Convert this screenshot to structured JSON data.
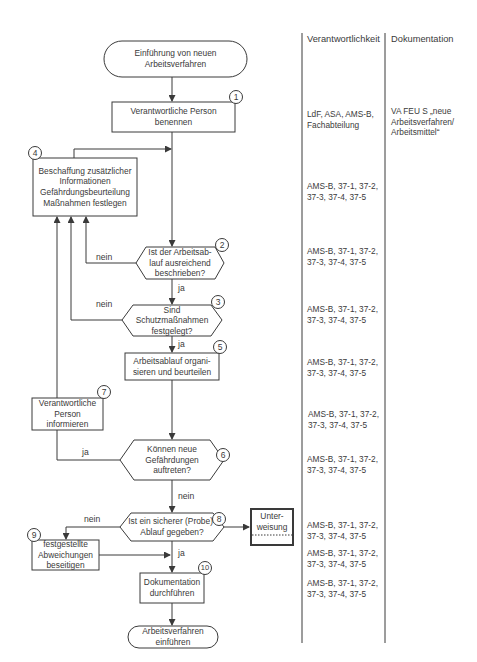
{
  "columns": {
    "responsibility_header": "Verantwortlichkeit",
    "documentation_header": "Dokumentation"
  },
  "nodes": {
    "start": "Einführung von neuen\nArbeitsverfahren",
    "step1": "Verantwortliche Person\nbenennen",
    "step4": "Beschaffung zusätzlicher\nInformationen\nGefährdungsbeurteilung\nMaßnahmen festlegen",
    "step2": "Ist der Arbeitsab-\nlauf ausreichend\nbeschrieben?",
    "step3": "Sind\nSchutzmaßnahmen\nfestgelegt?",
    "step5": "Arbeitsablauf organi-\nsieren und beurteilen",
    "step7": "Verantwortliche\nPerson\ninformieren",
    "step6": "Können neue\nGefährdungen\nauftreten?",
    "step8": "Ist ein sicherer (Probe)-\nAblauf gegeben?",
    "unterweisung": "Unter-\nweisung",
    "step9": "festgestellte\nAbweichungen\nbeseitigen",
    "step10": "Dokumentation\ndurchführen",
    "end": "Arbeitsverfahren\neinführen"
  },
  "step_numbers": {
    "n1": "1",
    "n2": "2",
    "n3": "3",
    "n4": "4",
    "n5": "5",
    "n6": "6",
    "n7": "7",
    "n8": "8",
    "n9": "9",
    "n10": "10"
  },
  "edge_labels": {
    "step2_no": "nein",
    "step2_yes": "ja",
    "step3_no": "nein",
    "step3_yes": "ja",
    "step6_yes": "ja",
    "step6_no": "nein",
    "step8_no": "nein",
    "step8_yes": "ja"
  },
  "responsibility": {
    "r1": "LdF, ASA, AMS-B,\nFachabteilung",
    "r4": "AMS-B, 37-1, 37-2,\n37-3, 37-4, 37-5",
    "r2": "AMS-B, 37-1, 37-2,\n37-3, 37-4, 37-5",
    "r3": "AMS-B, 37-1, 37-2,\n37-3, 37-4, 37-5",
    "r5": "AMS-B, 37-1, 37-2,\n37-3, 37-4, 37-5",
    "r7": "AMS-B, 37-1, 37-2,\n37-3, 37-4, 37-5",
    "r6": "AMS-B, 37-1, 37-2,\n37-3, 37-4, 37-5",
    "r8": "AMS-B, 37-1, 37-2,\n37-3, 37-4, 37-5",
    "r9": "AMS-B, 37-1, 37-2,\n37-3, 37-4, 37-5",
    "r10": "AMS-B, 37-1, 37-2,\n37-3, 37-4, 37-5"
  },
  "documentation": {
    "d1": "VA FEU S „neue\nArbeitsverfahren/\nArbeitsmittel“"
  },
  "colors": {
    "line": "#3a3a3a",
    "text": "#3a3a3a",
    "background": "#ffffff"
  }
}
